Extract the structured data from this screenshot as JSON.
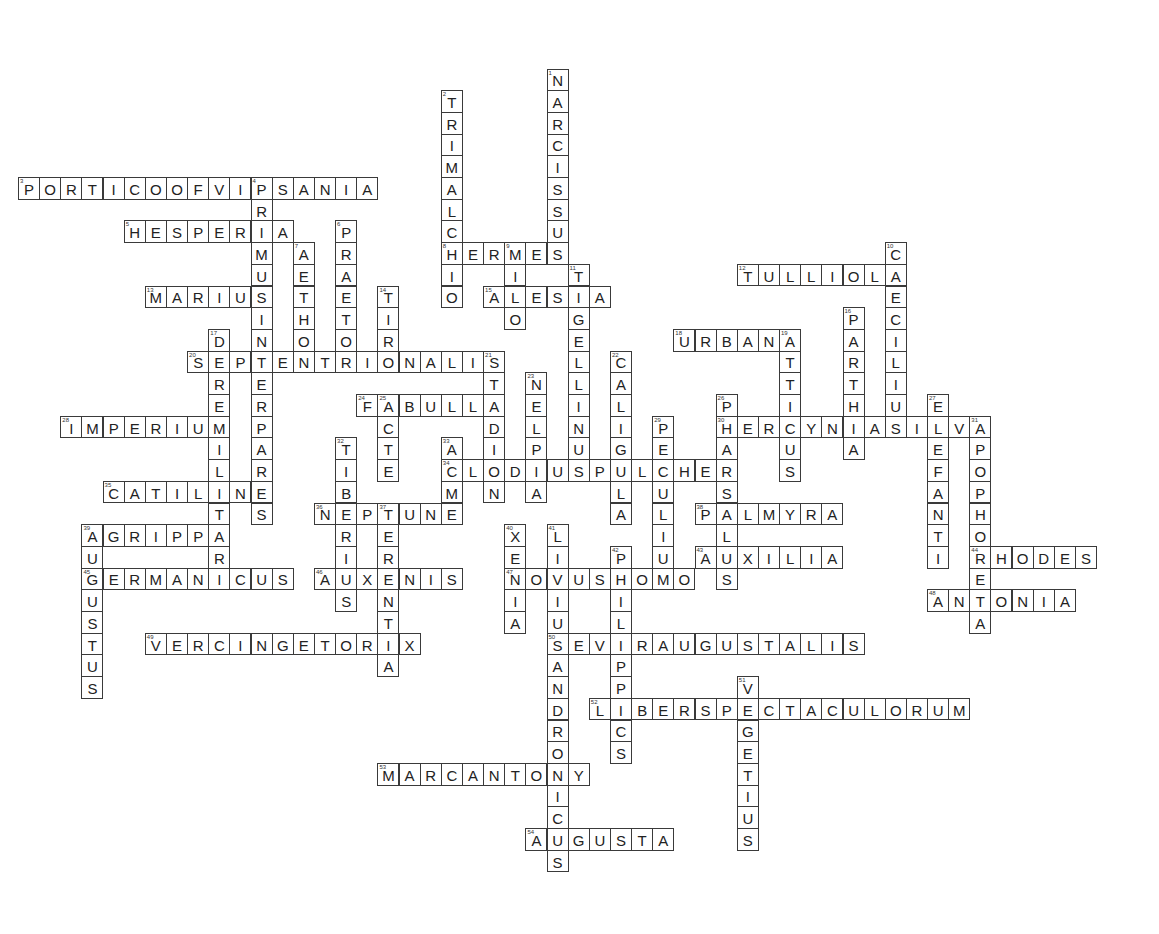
{
  "puzzle": {
    "type": "crossword",
    "grid": {
      "origin_x": 18,
      "origin_y": 177,
      "cell_w": 21.14,
      "cell_h": 21.7
    },
    "colors": {
      "border": "#3a3a3a",
      "text": "#222222",
      "background": "#ffffff"
    },
    "words": [
      {
        "num": 1,
        "answer": "NARCISSUS",
        "col": 25,
        "row": -5,
        "dir": "down"
      },
      {
        "num": 2,
        "answer": "TRIMALCHIO",
        "col": 20,
        "row": -4,
        "dir": "down"
      },
      {
        "num": 3,
        "answer": "PORTICOOFVIPSANIA",
        "col": 0,
        "row": 0,
        "dir": "across"
      },
      {
        "num": 4,
        "answer": "PRIMUSINTERPARES",
        "col": 11,
        "row": 0,
        "dir": "down"
      },
      {
        "num": 5,
        "answer": "HESPERIA",
        "col": 5,
        "row": 2,
        "dir": "across"
      },
      {
        "num": 6,
        "answer": "PRAETOR",
        "col": 15,
        "row": 2,
        "dir": "down"
      },
      {
        "num": 7,
        "answer": "AETHON",
        "col": 13,
        "row": 3,
        "dir": "down"
      },
      {
        "num": 8,
        "answer": "HERMES",
        "col": 20,
        "row": 3,
        "dir": "across"
      },
      {
        "num": 9,
        "answer": "MILO",
        "col": 23,
        "row": 3,
        "dir": "down"
      },
      {
        "num": 10,
        "answer": "CAECILIUS",
        "col": 41,
        "row": 3,
        "dir": "down"
      },
      {
        "num": 11,
        "answer": "TIGELLINUS",
        "col": 26,
        "row": 4,
        "dir": "down"
      },
      {
        "num": 12,
        "answer": "TULLIOLA",
        "col": 34,
        "row": 4,
        "dir": "across"
      },
      {
        "num": 13,
        "answer": "MARIUS",
        "col": 6,
        "row": 5,
        "dir": "across"
      },
      {
        "num": 14,
        "answer": "TIRO",
        "col": 17,
        "row": 5,
        "dir": "down"
      },
      {
        "num": 15,
        "answer": "ALESIA",
        "col": 22,
        "row": 5,
        "dir": "across"
      },
      {
        "num": 16,
        "answer": "PARTHIA",
        "col": 39,
        "row": 6,
        "dir": "down"
      },
      {
        "num": 17,
        "answer": "DEREMILITARI",
        "col": 9,
        "row": 7,
        "dir": "down"
      },
      {
        "num": 18,
        "answer": "URBANA",
        "col": 31,
        "row": 7,
        "dir": "across"
      },
      {
        "num": 19,
        "answer": "ATTICUS",
        "col": 36,
        "row": 7,
        "dir": "down"
      },
      {
        "num": 20,
        "answer": "SEPTENTRIONALIS",
        "col": 8,
        "row": 8,
        "dir": "across"
      },
      {
        "num": 21,
        "answer": "STADION",
        "col": 22,
        "row": 8,
        "dir": "down"
      },
      {
        "num": 22,
        "answer": "CALIGULA",
        "col": 28,
        "row": 8,
        "dir": "down"
      },
      {
        "num": 23,
        "answer": "NELPIA",
        "col": 24,
        "row": 9,
        "dir": "down"
      },
      {
        "num": 24,
        "answer": "FABULLA",
        "col": 16,
        "row": 10,
        "dir": "across"
      },
      {
        "num": 25,
        "answer": "ACTE",
        "col": 17,
        "row": 10,
        "dir": "down"
      },
      {
        "num": 26,
        "answer": "PHARSALUS",
        "col": 33,
        "row": 10,
        "dir": "down"
      },
      {
        "num": 27,
        "answer": "ELEFANTI",
        "col": 43,
        "row": 10,
        "dir": "down"
      },
      {
        "num": 28,
        "answer": "IMPERIUM",
        "col": 2,
        "row": 11,
        "dir": "across"
      },
      {
        "num": 29,
        "answer": "PECULIUM",
        "col": 30,
        "row": 11,
        "dir": "down"
      },
      {
        "num": 30,
        "answer": "HERCYNIASILVA",
        "col": 33,
        "row": 11,
        "dir": "across"
      },
      {
        "num": 31,
        "answer": "APOPHORETA",
        "col": 45,
        "row": 11,
        "dir": "down"
      },
      {
        "num": 32,
        "answer": "TIBERIUS",
        "col": 15,
        "row": 12,
        "dir": "down"
      },
      {
        "num": 33,
        "answer": "ACME",
        "col": 20,
        "row": 12,
        "dir": "down"
      },
      {
        "num": 34,
        "answer": "CLODIUSPULCHER",
        "col": 20,
        "row": 13,
        "dir": "across"
      },
      {
        "num": 35,
        "answer": "CATILINE",
        "col": 4,
        "row": 14,
        "dir": "across"
      },
      {
        "num": 36,
        "answer": "NEPTUNE",
        "col": 14,
        "row": 15,
        "dir": "across"
      },
      {
        "num": 37,
        "answer": "TERENTIA",
        "col": 17,
        "row": 15,
        "dir": "down"
      },
      {
        "num": 38,
        "answer": "PALMYRA",
        "col": 32,
        "row": 15,
        "dir": "across"
      },
      {
        "num": 39,
        "answer": "AGRIPPA",
        "col": 3,
        "row": 16,
        "dir": "across"
      },
      {
        "num": 39,
        "answer": "AUGUSTUS",
        "col": 3,
        "row": 16,
        "dir": "down"
      },
      {
        "num": 40,
        "answer": "XENIA",
        "col": 23,
        "row": 16,
        "dir": "down"
      },
      {
        "num": 41,
        "answer": "LIVIUSANDRONICUS",
        "col": 25,
        "row": 16,
        "dir": "down"
      },
      {
        "num": 42,
        "answer": "PHILIPPICS",
        "col": 28,
        "row": 17,
        "dir": "down"
      },
      {
        "num": 43,
        "answer": "AUXILIA",
        "col": 32,
        "row": 17,
        "dir": "across"
      },
      {
        "num": 44,
        "answer": "RHODES",
        "col": 45,
        "row": 17,
        "dir": "across"
      },
      {
        "num": 45,
        "answer": "GERMANICUS",
        "col": 3,
        "row": 18,
        "dir": "across"
      },
      {
        "num": 46,
        "answer": "AUXENIS",
        "col": 14,
        "row": 18,
        "dir": "across"
      },
      {
        "num": 47,
        "answer": "NOVUSHOMO",
        "col": 23,
        "row": 18,
        "dir": "across"
      },
      {
        "num": 48,
        "answer": "ANTONIA",
        "col": 43,
        "row": 19,
        "dir": "across"
      },
      {
        "num": 49,
        "answer": "VERCINGETORIX",
        "col": 6,
        "row": 21,
        "dir": "across"
      },
      {
        "num": 50,
        "answer": "SEVIRAUGUSTALIS",
        "col": 25,
        "row": 21,
        "dir": "across"
      },
      {
        "num": 51,
        "answer": "VEGETIUS",
        "col": 34,
        "row": 23,
        "dir": "down"
      },
      {
        "num": 52,
        "answer": "LIBERSPECTACULORUM",
        "col": 27,
        "row": 24,
        "dir": "across"
      },
      {
        "num": 53,
        "answer": "MARCANTONY",
        "col": 17,
        "row": 27,
        "dir": "across"
      },
      {
        "num": 54,
        "answer": "AUGUSTA",
        "col": 24,
        "row": 30,
        "dir": "across"
      }
    ]
  }
}
